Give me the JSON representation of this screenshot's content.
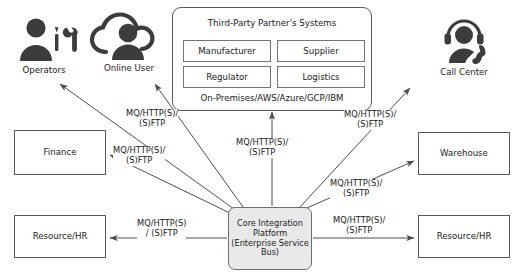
{
  "diagram": {
    "hub": {
      "label": "Core Integration Platform (Enterprise Service Bus)",
      "line1": "Core Integration",
      "line2": "Platform",
      "line3": "(Enterprise Service",
      "line4": "Bus)",
      "fill": "#e9e9e9",
      "stroke": "#6e6e6e"
    },
    "partner_panel": {
      "title": "Third-Party Partner's Systems",
      "footer": "On-Premises/AWS/Azure/GCP/IBM",
      "boxes": [
        {
          "label": "Manufacturer"
        },
        {
          "label": "Supplier"
        },
        {
          "label": "Regulator"
        },
        {
          "label": "Logistics"
        }
      ]
    },
    "actors": [
      {
        "name": "operators",
        "label": "Operators",
        "icon": "operator-technician-icon"
      },
      {
        "name": "online-user",
        "label": "Online User",
        "icon": "cloud-user-icon"
      },
      {
        "name": "call-center",
        "label": "Call Center",
        "icon": "headset-agent-icon"
      }
    ],
    "systems": [
      {
        "name": "finance",
        "label": "Finance"
      },
      {
        "name": "resource-hr-left",
        "label": "Resource/HR"
      },
      {
        "name": "warehouse",
        "label": "Warehouse"
      },
      {
        "name": "resource-hr-right",
        "label": "Resource/HR"
      }
    ],
    "edge_labels": {
      "upper_left": "MQ/HTTP(S)/\n(S)FTP",
      "mid_left": "MQ/HTTP(S)/\n(S)FTP",
      "top_center": "MQ/HTTP(S)/\n(S)FTP",
      "upper_right": "MQ/HTTP(S)/\n(S)FTP",
      "mid_right": "MQ/HTTP(S)/\n(S)FTP",
      "bottom_left": "MQ/HTTP(S)\n/ (S)FTP",
      "bottom_right": "MQ/HTTP(S)/\n(S)FTP"
    },
    "colors": {
      "line": "#4d4d4d",
      "box_stroke": "#595959",
      "icon": "#3c3c3c",
      "background": "#ffffff"
    }
  }
}
